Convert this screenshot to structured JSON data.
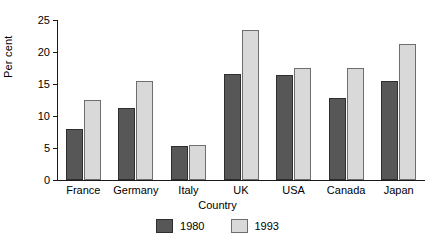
{
  "chart_data": {
    "type": "bar",
    "title": "",
    "subtitle": "",
    "xlabel": "Country",
    "ylabel": "Per cent",
    "categories": [
      "France",
      "Germany",
      "Italy",
      "UK",
      "USA",
      "Canada",
      "Japan"
    ],
    "series": [
      {
        "name": "1980",
        "color": "#575757",
        "values": [
          8.0,
          11.2,
          5.3,
          16.5,
          16.4,
          12.8,
          15.5
        ]
      },
      {
        "name": "1993",
        "color": "#d9d9d9",
        "values": [
          12.5,
          15.5,
          5.4,
          23.5,
          17.5,
          17.5,
          21.2
        ]
      }
    ],
    "ylim": [
      0,
      25
    ],
    "yticks": [
      0,
      5,
      10,
      15,
      20,
      25
    ],
    "ytick_labels": [
      "0",
      "5",
      "10",
      "15",
      "20",
      "25"
    ],
    "grid": false,
    "legend_position": "bottom-center",
    "annotations": []
  },
  "legend": {
    "entries": [
      {
        "label": "1980"
      },
      {
        "label": "1993"
      }
    ]
  },
  "axes": {
    "y_title": "Per cent",
    "x_title": "Country"
  }
}
